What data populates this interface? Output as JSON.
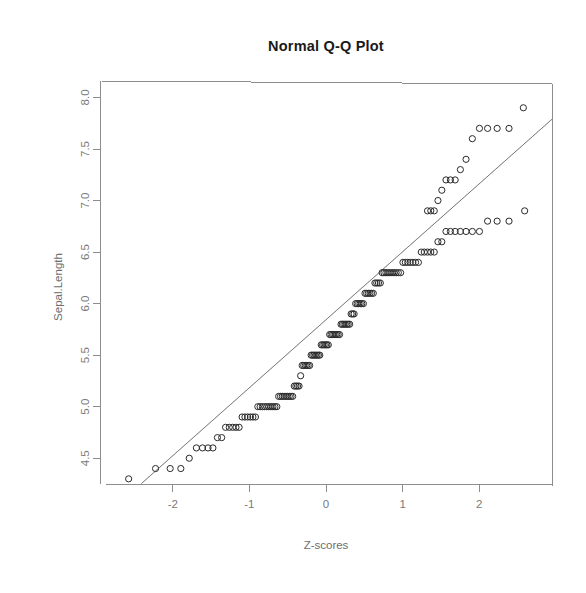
{
  "chart_data": {
    "type": "scatter",
    "title": "Normal Q-Q Plot",
    "xlabel": "Z-scores",
    "ylabel": "Sepal.Length",
    "grid": false,
    "legend": "none",
    "xlim": [
      -2.95,
      2.95
    ],
    "ylim": [
      4.25,
      8.15
    ],
    "xticks": [
      "-2",
      "-1",
      "0",
      "1",
      "2"
    ],
    "xtick_values": [
      -2,
      -1,
      0,
      1,
      2
    ],
    "yticks": [
      "4.5",
      "5.0",
      "5.5",
      "6.0",
      "6.5",
      "7.0",
      "7.5",
      "8.0"
    ],
    "ytick_values": [
      4.5,
      5.0,
      5.5,
      6.0,
      6.5,
      7.0,
      7.5,
      8.0
    ],
    "n_points": 150,
    "marker": "open-circle",
    "marker_size": 3.1,
    "marker_color": "#2a2a2a",
    "reference_line": {
      "type": "qqline",
      "slope": 0.6595,
      "intercept": 5.8433,
      "color": "#5a5a5a"
    },
    "series": [
      {
        "name": "Sepal.Length quantiles",
        "x": [
          -2.576,
          -2.225,
          -2.034,
          -1.895,
          -1.785,
          -1.692,
          -1.612,
          -1.54,
          -1.476,
          -1.417,
          -1.362,
          -1.311,
          -1.263,
          -1.218,
          -1.175,
          -1.134,
          -1.095,
          -1.058,
          -1.022,
          -0.987,
          -0.954,
          -0.921,
          -0.89,
          -0.86,
          -0.83,
          -0.801,
          -0.773,
          -0.746,
          -0.719,
          -0.693,
          -0.667,
          -0.642,
          -0.618,
          -0.594,
          -0.57,
          -0.547,
          -0.524,
          -0.501,
          -0.479,
          -0.457,
          -0.435,
          -0.414,
          -0.393,
          -0.372,
          -0.352,
          -0.331,
          -0.311,
          -0.291,
          -0.271,
          -0.252,
          -0.232,
          -0.213,
          -0.194,
          -0.175,
          -0.156,
          -0.137,
          -0.118,
          -0.099,
          -0.081,
          -0.062,
          -0.044,
          -0.025,
          -0.007,
          0.011,
          0.03,
          0.048,
          0.066,
          0.085,
          0.103,
          0.122,
          0.14,
          0.159,
          0.177,
          0.196,
          0.214,
          0.233,
          0.252,
          0.271,
          0.29,
          0.309,
          0.328,
          0.348,
          0.367,
          0.387,
          0.407,
          0.427,
          0.447,
          0.467,
          0.488,
          0.509,
          0.53,
          0.551,
          0.573,
          0.595,
          0.617,
          0.639,
          0.662,
          0.685,
          0.709,
          0.733,
          0.757,
          0.782,
          0.808,
          0.834,
          0.861,
          0.888,
          0.916,
          0.944,
          0.974,
          1.004,
          1.035,
          1.067,
          1.1,
          1.134,
          1.169,
          1.206,
          1.244,
          1.283,
          1.325,
          1.368,
          1.413,
          1.461,
          1.512,
          1.566,
          1.624,
          1.686,
          1.754,
          1.828,
          1.91,
          2.003,
          2.109,
          2.234,
          2.389,
          2.593,
          2.576,
          2.389,
          2.234,
          2.109,
          2.003,
          1.91,
          1.828,
          1.754,
          1.686,
          1.624,
          1.566,
          1.512,
          1.461,
          1.413,
          1.368,
          1.325
        ],
        "y": [
          4.3,
          4.4,
          4.4,
          4.4,
          4.5,
          4.6,
          4.6,
          4.6,
          4.6,
          4.7,
          4.7,
          4.8,
          4.8,
          4.8,
          4.8,
          4.8,
          4.9,
          4.9,
          4.9,
          4.9,
          4.9,
          4.9,
          5.0,
          5.0,
          5.0,
          5.0,
          5.0,
          5.0,
          5.0,
          5.0,
          5.0,
          5.0,
          5.1,
          5.1,
          5.1,
          5.1,
          5.1,
          5.1,
          5.1,
          5.1,
          5.1,
          5.2,
          5.2,
          5.2,
          5.2,
          5.3,
          5.4,
          5.4,
          5.4,
          5.4,
          5.4,
          5.4,
          5.5,
          5.5,
          5.5,
          5.5,
          5.5,
          5.5,
          5.5,
          5.6,
          5.6,
          5.6,
          5.6,
          5.6,
          5.6,
          5.7,
          5.7,
          5.7,
          5.7,
          5.7,
          5.7,
          5.7,
          5.7,
          5.8,
          5.8,
          5.8,
          5.8,
          5.8,
          5.8,
          5.8,
          5.9,
          5.9,
          5.9,
          6.0,
          6.0,
          6.0,
          6.0,
          6.0,
          6.0,
          6.1,
          6.1,
          6.1,
          6.1,
          6.1,
          6.1,
          6.2,
          6.2,
          6.2,
          6.2,
          6.3,
          6.3,
          6.3,
          6.3,
          6.3,
          6.3,
          6.3,
          6.3,
          6.3,
          6.3,
          6.4,
          6.4,
          6.4,
          6.4,
          6.4,
          6.4,
          6.4,
          6.5,
          6.5,
          6.5,
          6.5,
          6.5,
          6.6,
          6.6,
          6.7,
          6.7,
          6.7,
          6.7,
          6.7,
          6.7,
          6.7,
          6.8,
          6.8,
          6.8,
          6.9,
          7.9,
          7.7,
          7.7,
          7.7,
          7.7,
          7.6,
          7.4,
          7.3,
          7.2,
          7.2,
          7.2,
          7.1,
          7.0,
          6.9,
          6.9,
          6.9
        ]
      }
    ]
  }
}
